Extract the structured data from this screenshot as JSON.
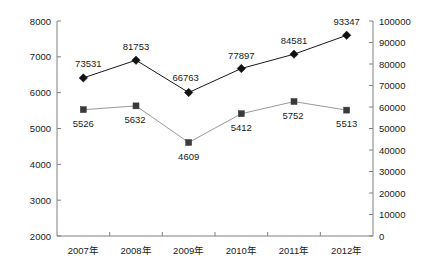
{
  "chart_data": {
    "type": "line",
    "title": "",
    "subtitle": "",
    "xlabel": "",
    "ylabel": "",
    "grid": false,
    "legend": "none",
    "categories": [
      "2007年",
      "2008年",
      "2009年",
      "2010年",
      "2011年",
      "2012年"
    ],
    "axes": {
      "left": {
        "ylim": [
          2000,
          8000
        ],
        "ticks": [
          2000,
          3000,
          4000,
          5000,
          6000,
          7000,
          8000
        ],
        "tick_labels": [
          "2000",
          "3000",
          "4000",
          "5000",
          "6000",
          "7000",
          "8000"
        ]
      },
      "right": {
        "ylim": [
          0,
          100000
        ],
        "ticks": [
          0,
          10000,
          20000,
          30000,
          40000,
          50000,
          60000,
          70000,
          80000,
          90000,
          100000
        ],
        "tick_labels": [
          "0",
          "10000",
          "20000",
          "30000",
          "40000",
          "50000",
          "60000",
          "70000",
          "80000",
          "90000",
          "100000"
        ]
      }
    },
    "series": [
      {
        "name": "series-diamond",
        "axis": "right",
        "marker": "diamond",
        "color": "#111111",
        "values": [
          73531,
          81753,
          66763,
          77897,
          84581,
          93347
        ],
        "labels": [
          "73531",
          "81753",
          "66763",
          "77897",
          "84581",
          "93347"
        ]
      },
      {
        "name": "series-square",
        "axis": "left",
        "marker": "square",
        "color": "#3a3a3a",
        "values": [
          5526,
          5632,
          4609,
          5412,
          5752,
          5513
        ],
        "labels": [
          "5526",
          "5632",
          "4609",
          "5412",
          "5752",
          "5513"
        ]
      }
    ]
  }
}
